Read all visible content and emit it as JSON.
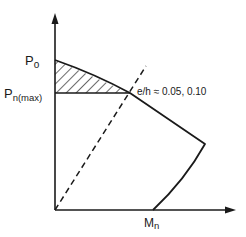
{
  "diagram": {
    "axes": {
      "y_label_top": "P",
      "y_label_top_sub": "o",
      "y_label_mid": "P",
      "y_label_mid_sub": "n(max)",
      "x_label": "M",
      "x_label_sub": "n"
    },
    "annotation": "e/h ≈ 0.05, 0.10",
    "colors": {
      "line": "#1a1a1a",
      "background": "#ffffff"
    }
  }
}
